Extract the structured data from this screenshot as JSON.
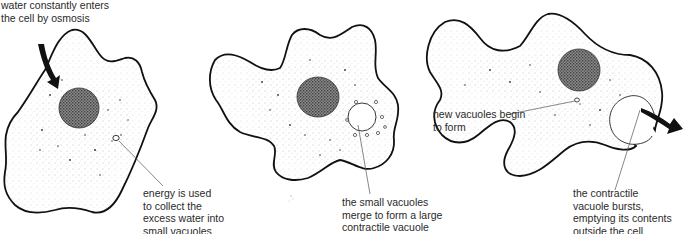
{
  "diagram": {
    "stages": [
      {
        "id": "stage-1",
        "labels": [
          {
            "name": "osmosis-label",
            "text": "water constantly enters\nthe cell by osmosis"
          },
          {
            "name": "energy-label",
            "text": "energy is used\nto collect the\nexcess water into\nsmall vacuoles"
          }
        ]
      },
      {
        "id": "stage-2",
        "labels": [
          {
            "name": "merge-label",
            "text": "the small vacuoles\nmerge to form a large\ncontractile vacuole"
          }
        ]
      },
      {
        "id": "stage-3",
        "labels": [
          {
            "name": "new-vacuoles-label",
            "text": "new vacuoles begin\nto form"
          },
          {
            "name": "burst-label",
            "text": "the contractile\nvacuole bursts,\nemptying its contents\noutside the cell"
          }
        ]
      }
    ],
    "colors": {
      "outline": "#111111",
      "cytoplasm_stipple": "#cfcfcf",
      "nucleus": "#3a3a3a",
      "text": "#2a2a2a",
      "leader_line": "#555555"
    }
  }
}
